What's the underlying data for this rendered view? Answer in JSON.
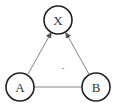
{
  "diagram": {
    "nodes": [
      {
        "id": "X",
        "label": "X",
        "cx": 58,
        "cy": 20
      },
      {
        "id": "A",
        "label": "A",
        "cx": 20,
        "cy": 87
      },
      {
        "id": "B",
        "label": "B",
        "cx": 96,
        "cy": 87
      }
    ],
    "edges": [
      {
        "from": "A",
        "to": "X",
        "directed": true
      },
      {
        "from": "B",
        "to": "X",
        "directed": true
      },
      {
        "from": "A",
        "to": "B",
        "directed": false
      }
    ],
    "center_mark": "-",
    "colors": {
      "stroke": "#222222",
      "edge": "#666666",
      "text": "#333333"
    }
  }
}
